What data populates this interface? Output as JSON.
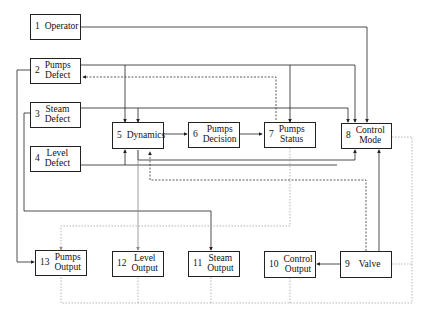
{
  "diagram": {
    "type": "block-diagram",
    "nodes": [
      {
        "id": 1,
        "num": "1",
        "label": "Operator"
      },
      {
        "id": 2,
        "num": "2",
        "label": "Pumps Defect",
        "line1": "Pumps",
        "line2": "Defect"
      },
      {
        "id": 3,
        "num": "3",
        "label": "Steam Defect",
        "line1": "Steam",
        "line2": "Defect"
      },
      {
        "id": 4,
        "num": "4",
        "label": "Level Defect",
        "line1": "Level",
        "line2": "Defect"
      },
      {
        "id": 5,
        "num": "5",
        "label": "Dynamics"
      },
      {
        "id": 6,
        "num": "6",
        "label": "Pumps Decision",
        "line1": "Pumps",
        "line2": "Decision"
      },
      {
        "id": 7,
        "num": "7",
        "label": "Pumps Status",
        "line1": "Pumps",
        "line2": "Status"
      },
      {
        "id": 8,
        "num": "8",
        "label": "Control Mode",
        "line1": "Control",
        "line2": "Mode"
      },
      {
        "id": 9,
        "num": "9",
        "label": "Valve"
      },
      {
        "id": 10,
        "num": "10",
        "label": "Control Output",
        "line1": "Control",
        "line2": "Output"
      },
      {
        "id": 11,
        "num": "11",
        "label": "Steam Output",
        "line1": "Steam",
        "line2": "Output"
      },
      {
        "id": 12,
        "num": "12",
        "label": "Level Output",
        "line1": "Level",
        "line2": "Output"
      },
      {
        "id": 13,
        "num": "13",
        "label": "Pumps Output",
        "line1": "Pumps",
        "line2": "Output"
      }
    ],
    "edges": [
      {
        "from": 1,
        "to": 8,
        "style": "solid"
      },
      {
        "from": 2,
        "to": 5,
        "style": "solid"
      },
      {
        "from": 2,
        "to": 7,
        "style": "solid"
      },
      {
        "from": 2,
        "to": 8,
        "style": "solid"
      },
      {
        "from": 7,
        "to": 2,
        "style": "dashed"
      },
      {
        "from": 2,
        "to": 13,
        "style": "solid"
      },
      {
        "from": 3,
        "to": 5,
        "style": "solid"
      },
      {
        "from": 3,
        "to": 8,
        "style": "solid"
      },
      {
        "from": 3,
        "to": 11,
        "style": "solid"
      },
      {
        "from": 4,
        "to": 5,
        "style": "solid"
      },
      {
        "from": 5,
        "to": 6,
        "style": "solid"
      },
      {
        "from": 6,
        "to": 7,
        "style": "solid"
      },
      {
        "from": 5,
        "to": 8,
        "style": "solid"
      },
      {
        "from": 5,
        "to": 12,
        "style": "solid"
      },
      {
        "from": 9,
        "to": 5,
        "style": "dashed"
      },
      {
        "from": 7,
        "to": 13,
        "style": "dotted"
      },
      {
        "from": 8,
        "to": 9,
        "style": "solid-bidirectional"
      },
      {
        "from": 9,
        "to": 10,
        "style": "solid"
      },
      {
        "from": 8,
        "to": "bottom-bus",
        "style": "dotted"
      },
      {
        "from": "bottom-bus",
        "to": [
          13,
          12,
          11,
          10
        ],
        "style": "dotted"
      }
    ]
  }
}
